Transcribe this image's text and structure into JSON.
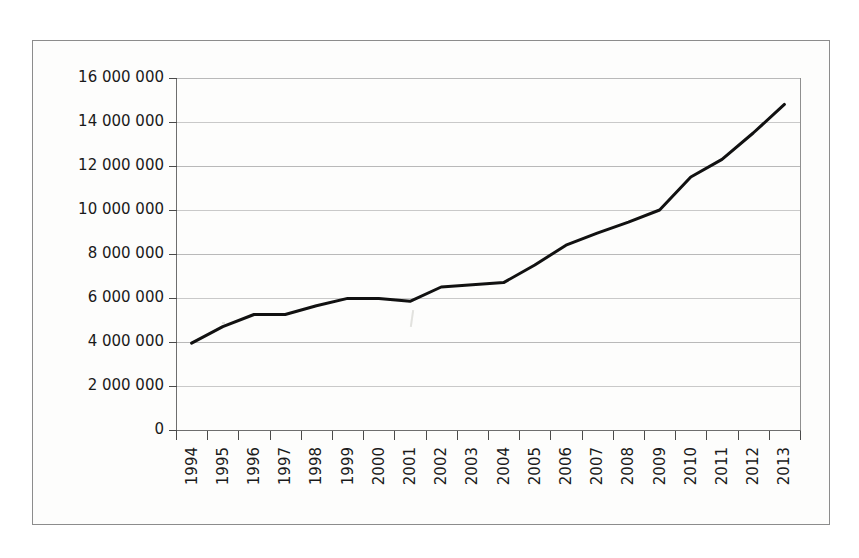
{
  "figure": {
    "background_color": "#fdfdfc",
    "frame_color": "#8c8c8c",
    "line_color": "#111111",
    "gridline_color": "#b9b9b9",
    "tick_color": "#4a4a4a"
  },
  "chart_data": {
    "type": "line",
    "title": "",
    "subtitle": "",
    "xlabel": "",
    "ylabel": "",
    "categories": [
      "1994",
      "1995",
      "1996",
      "1997",
      "1998",
      "1999",
      "2000",
      "2001",
      "2002",
      "2003",
      "2004",
      "2005",
      "2006",
      "2007",
      "2008",
      "2009",
      "2010",
      "2011",
      "2012",
      "2013"
    ],
    "x": [
      1994,
      1995,
      1996,
      1997,
      1998,
      1999,
      2000,
      2001,
      2002,
      2003,
      2004,
      2005,
      2006,
      2007,
      2008,
      2009,
      2010,
      2011,
      2012,
      2013
    ],
    "values": [
      3950000,
      4700000,
      5250000,
      5250000,
      5650000,
      5980000,
      5980000,
      5850000,
      6500000,
      6600000,
      6700000,
      7500000,
      8400000,
      8950000,
      9450000,
      10000000,
      11500000,
      12300000,
      13500000,
      14800000
    ],
    "series": [
      {
        "name": "",
        "values": [
          3950000,
          4700000,
          5250000,
          5250000,
          5650000,
          5980000,
          5980000,
          5850000,
          6500000,
          6600000,
          6700000,
          7500000,
          8400000,
          8950000,
          9450000,
          10000000,
          11500000,
          12300000,
          13500000,
          14800000
        ]
      }
    ],
    "ylim": [
      0,
      16000000
    ],
    "ytick_values": [
      0,
      2000000,
      4000000,
      6000000,
      8000000,
      10000000,
      12000000,
      14000000,
      16000000
    ],
    "ytick_labels": [
      "0",
      "2 000 000",
      "4 000 000",
      "6 000 000",
      "8 000 000",
      "10 000 000",
      "12 000 000",
      "14 000 000",
      "16 000 000"
    ],
    "grid": true,
    "legend": "none",
    "annotations": [],
    "marker": "none",
    "line_width": 3
  }
}
